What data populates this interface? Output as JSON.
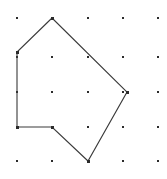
{
  "figure": {
    "name": "geoboard-lattice-polygon",
    "width": 167,
    "height": 179,
    "background_color": "#ffffff"
  },
  "grid": {
    "name": "dot-lattice",
    "columns": 5,
    "rows": 5,
    "x_positions": [
      17,
      52,
      88,
      123,
      158
    ],
    "y_positions": [
      18,
      57,
      92,
      127,
      161
    ],
    "dot_color": "#2b2b2b",
    "dot_size": 2.4,
    "dots": [
      {
        "x": 17,
        "y": 18
      },
      {
        "x": 52,
        "y": 18
      },
      {
        "x": 88,
        "y": 18
      },
      {
        "x": 123,
        "y": 18
      },
      {
        "x": 158,
        "y": 18
      },
      {
        "x": 17,
        "y": 57
      },
      {
        "x": 52,
        "y": 57
      },
      {
        "x": 88,
        "y": 57
      },
      {
        "x": 123,
        "y": 57
      },
      {
        "x": 158,
        "y": 57
      },
      {
        "x": 17,
        "y": 92
      },
      {
        "x": 52,
        "y": 92
      },
      {
        "x": 88,
        "y": 92
      },
      {
        "x": 123,
        "y": 92
      },
      {
        "x": 158,
        "y": 92
      },
      {
        "x": 17,
        "y": 127
      },
      {
        "x": 52,
        "y": 127
      },
      {
        "x": 88,
        "y": 127
      },
      {
        "x": 123,
        "y": 127
      },
      {
        "x": 158,
        "y": 127
      },
      {
        "x": 17,
        "y": 161
      },
      {
        "x": 52,
        "y": 161
      },
      {
        "x": 88,
        "y": 161
      },
      {
        "x": 123,
        "y": 161
      },
      {
        "x": 158,
        "y": 161
      }
    ]
  },
  "polygon": {
    "name": "hexagon-outline",
    "stroke_color": "#3a3a3a",
    "stroke_width": 1.1,
    "closed": true,
    "vertex_count": 6,
    "points_string": "52,18 127,92 88,161 52,127 17,127 17,52",
    "vertices": [
      {
        "label": "apex-top",
        "x": 52,
        "y": 18,
        "grid_col": 1,
        "grid_row": 0
      },
      {
        "label": "right",
        "x": 127,
        "y": 92,
        "grid_col": 3,
        "grid_row": 2
      },
      {
        "label": "bottom",
        "x": 88,
        "y": 161,
        "grid_col": 2,
        "grid_row": 4
      },
      {
        "label": "notch-inner",
        "x": 52,
        "y": 127,
        "grid_col": 1,
        "grid_row": 3
      },
      {
        "label": "bottom-left",
        "x": 17,
        "y": 127,
        "grid_col": 0,
        "grid_row": 3
      },
      {
        "label": "upper-left",
        "x": 17,
        "y": 52,
        "grid_col": 0,
        "grid_row": 1
      }
    ],
    "edges": [
      {
        "from": "apex-top",
        "to": "right"
      },
      {
        "from": "right",
        "to": "bottom"
      },
      {
        "from": "bottom",
        "to": "notch-inner"
      },
      {
        "from": "notch-inner",
        "to": "bottom-left"
      },
      {
        "from": "bottom-left",
        "to": "upper-left"
      },
      {
        "from": "upper-left",
        "to": "apex-top"
      }
    ]
  }
}
